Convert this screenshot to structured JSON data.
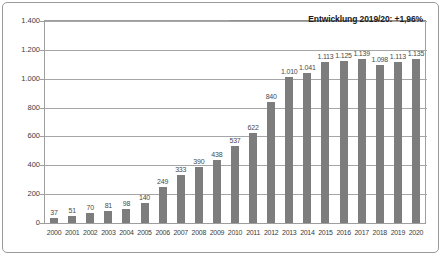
{
  "chart_data": {
    "type": "bar",
    "title": "Entwicklung 2019/20: +1,96%",
    "xlabel": "",
    "ylabel": "",
    "ylim": [
      0,
      1400
    ],
    "grid": true,
    "legend": false,
    "categories": [
      "2000",
      "2001",
      "2002",
      "2003",
      "2004",
      "2005",
      "2006",
      "2007",
      "2008",
      "2009",
      "2010",
      "2011",
      "2012",
      "2013",
      "2014",
      "2015",
      "2016",
      "2017",
      "2018",
      "2019",
      "2020"
    ],
    "values": [
      37,
      51,
      70,
      81,
      98,
      140,
      249,
      333,
      390,
      438,
      537,
      622,
      840,
      1010,
      1041,
      1113,
      1125,
      1139,
      1098,
      1113,
      1135
    ],
    "value_labels": [
      "37",
      "51",
      "70",
      "81",
      "98",
      "140",
      "249",
      "333",
      "390",
      "438",
      "537",
      "622",
      "840",
      "1.010",
      "1.041",
      "1.113",
      "1.125",
      "1.139",
      "1.098",
      "1.113",
      "1.135"
    ],
    "y_ticks": [
      0,
      200,
      400,
      600,
      800,
      1000,
      1200,
      1400
    ],
    "y_tick_labels": [
      "0",
      "200",
      "400",
      "600",
      "800",
      "1.000",
      "1.200",
      "1.400"
    ],
    "series_color": "#7d7d7d"
  },
  "chart": {
    "title": "Entwicklung 2019/20: +1,96%"
  }
}
